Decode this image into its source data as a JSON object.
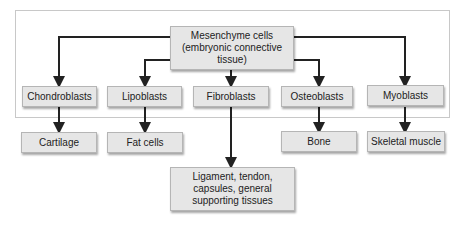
{
  "diagram": {
    "root": "Mesenchyme cells (embryonic connective tissue)",
    "root_lines": [
      "Mesenchyme cells",
      "(embryonic connective",
      "tissue)"
    ],
    "cells": [
      {
        "name": "Chondroblasts",
        "product": "Cartilage"
      },
      {
        "name": "Lipoblasts",
        "product": "Fat cells"
      },
      {
        "name": "Fibroblasts",
        "product": "Ligament, tendon, capsules, general supporting tissues",
        "product_lines": [
          "Ligament, tendon,",
          "capsules, general",
          "supporting tissues"
        ]
      },
      {
        "name": "Osteoblasts",
        "product": "Bone"
      },
      {
        "name": "Myoblasts",
        "product": "Skeletal muscle"
      }
    ]
  }
}
